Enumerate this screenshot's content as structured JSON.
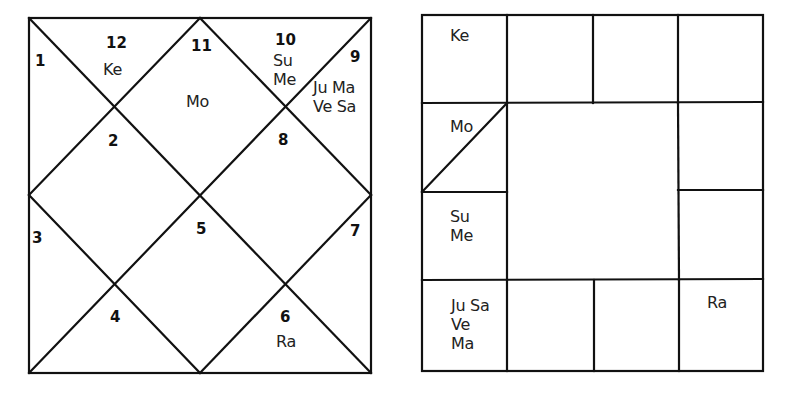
{
  "north_chart": {
    "style": "North Indian diamond chart",
    "houses": [
      {
        "house": "1",
        "planets": ""
      },
      {
        "house": "2",
        "planets": ""
      },
      {
        "house": "3",
        "planets": ""
      },
      {
        "house": "4",
        "planets": ""
      },
      {
        "house": "5",
        "planets": ""
      },
      {
        "house": "6",
        "planets": "Ra"
      },
      {
        "house": "7",
        "planets": ""
      },
      {
        "house": "8",
        "planets": ""
      },
      {
        "house": "9",
        "planets": "Ju Ma\nVe Sa"
      },
      {
        "house": "10",
        "planets": "Su\nMe"
      },
      {
        "house": "11",
        "planets": "Mo"
      },
      {
        "house": "12",
        "planets": "Ke"
      }
    ]
  },
  "south_chart": {
    "style": "South Indian square chart",
    "cells": {
      "r0c0": "Ke",
      "r0c1": "",
      "r0c2": "",
      "r0c3": "",
      "r1c0": "Mo",
      "r1c3": "",
      "r2c0": "Su\nMe",
      "r2c3": "",
      "r3c0": "Ju Sa\nVe\nMa",
      "r3c1": "",
      "r3c2": "",
      "r3c3": "Ra"
    }
  }
}
